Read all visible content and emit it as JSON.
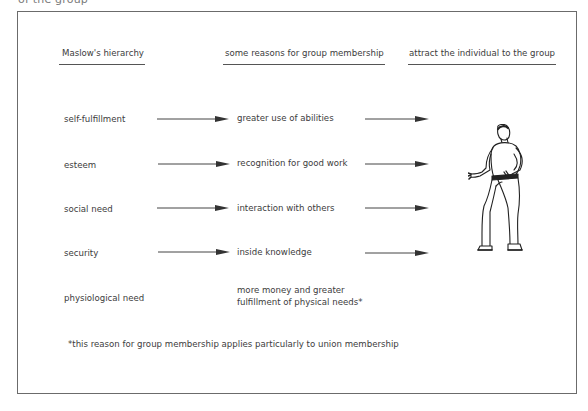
{
  "top_caption_cut": "of the group",
  "headers": {
    "col1": "Maslow's hierarchy",
    "col2": "some reasons for group membership",
    "col3": "attract the individual to the group"
  },
  "rows": [
    {
      "need": "self-fulfillment",
      "reason": "greater use of abilities",
      "has_arrows": true
    },
    {
      "need": "esteem",
      "reason": "recognition for good work",
      "has_arrows": true
    },
    {
      "need": "social need",
      "reason": "interaction with others",
      "has_arrows": true
    },
    {
      "need": "security",
      "reason": "inside knowledge",
      "has_arrows": true
    },
    {
      "need": "physiological need",
      "reason_line1": "more money and greater",
      "reason_line2": "fulfillment of physical needs*",
      "has_arrows": false
    }
  ],
  "footnote": "*this reason for group membership applies particularly to union  membership",
  "figure": {
    "icon": "walking-man-illustration"
  },
  "colors": {
    "line": "#555555",
    "text": "#3c3c3c",
    "frame": "#6b6b6b"
  }
}
